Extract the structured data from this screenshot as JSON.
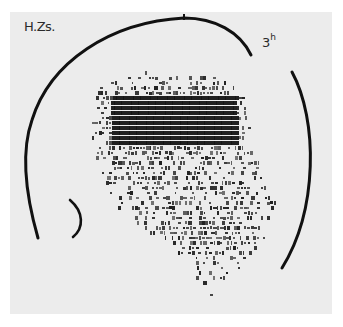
{
  "figure": {
    "subject_label": "H.Zs.",
    "time_label": {
      "value": "3",
      "unit": "h"
    },
    "background_color": "#ececec",
    "ink_color": "#151515"
  },
  "head_outline": {
    "main_arc_path": "M 38 238 C 30 210 18 160 32 120 C 50 62 110 22 184 18 C 215 18 240 32 251 55",
    "right_arc_path": "M 292 72 C 318 120 318 210 282 268",
    "ear_arc_path": "M 70 200 C 84 212 84 228 73 237",
    "top_tick": {
      "x": 184,
      "y1": 14,
      "y2": 20
    }
  },
  "chart_data": {
    "type": "heatmap",
    "row_height_px": 4.8,
    "rows": [
      {
        "y": 66,
        "x0": 160,
        "x1": 210,
        "density": 0.08
      },
      {
        "y": 71,
        "x0": 128,
        "x1": 215,
        "density": 0.15
      },
      {
        "y": 76,
        "x0": 118,
        "x1": 225,
        "density": 0.3
      },
      {
        "y": 81,
        "x0": 108,
        "x1": 232,
        "density": 0.45
      },
      {
        "y": 86,
        "x0": 100,
        "x1": 240,
        "density": 0.6
      },
      {
        "y": 91,
        "x0": 98,
        "x1": 244,
        "density": 0.8
      },
      {
        "y": 96,
        "x0": 96,
        "x1": 246,
        "density": 0.92
      },
      {
        "y": 101,
        "x0": 94,
        "x1": 248,
        "density": 0.97
      },
      {
        "y": 106,
        "x0": 94,
        "x1": 250,
        "density": 0.97
      },
      {
        "y": 111,
        "x0": 94,
        "x1": 250,
        "density": 0.96
      },
      {
        "y": 116,
        "x0": 92,
        "x1": 250,
        "density": 0.95
      },
      {
        "y": 121,
        "x0": 92,
        "x1": 250,
        "density": 0.94
      },
      {
        "y": 126,
        "x0": 92,
        "x1": 250,
        "density": 0.92
      },
      {
        "y": 131,
        "x0": 92,
        "x1": 250,
        "density": 0.9
      },
      {
        "y": 136,
        "x0": 92,
        "x1": 252,
        "density": 0.85
      },
      {
        "y": 141,
        "x0": 92,
        "x1": 252,
        "density": 0.8
      },
      {
        "y": 146,
        "x0": 92,
        "x1": 252,
        "density": 0.72
      },
      {
        "y": 151,
        "x0": 94,
        "x1": 254,
        "density": 0.65
      },
      {
        "y": 156,
        "x0": 96,
        "x1": 256,
        "density": 0.6
      },
      {
        "y": 161,
        "x0": 98,
        "x1": 258,
        "density": 0.55
      },
      {
        "y": 166,
        "x0": 100,
        "x1": 260,
        "density": 0.5
      },
      {
        "y": 171,
        "x0": 102,
        "x1": 262,
        "density": 0.45
      },
      {
        "y": 176,
        "x0": 104,
        "x1": 264,
        "density": 0.45
      },
      {
        "y": 181,
        "x0": 106,
        "x1": 266,
        "density": 0.5
      },
      {
        "y": 186,
        "x0": 108,
        "x1": 268,
        "density": 0.5
      },
      {
        "y": 191,
        "x0": 110,
        "x1": 270,
        "density": 0.45
      },
      {
        "y": 196,
        "x0": 112,
        "x1": 272,
        "density": 0.45
      },
      {
        "y": 201,
        "x0": 114,
        "x1": 274,
        "density": 0.45
      },
      {
        "y": 206,
        "x0": 118,
        "x1": 274,
        "density": 0.5
      },
      {
        "y": 211,
        "x0": 122,
        "x1": 274,
        "density": 0.55
      },
      {
        "y": 216,
        "x0": 128,
        "x1": 272,
        "density": 0.55
      },
      {
        "y": 221,
        "x0": 134,
        "x1": 270,
        "density": 0.6
      },
      {
        "y": 226,
        "x0": 142,
        "x1": 268,
        "density": 0.6
      },
      {
        "y": 231,
        "x0": 150,
        "x1": 266,
        "density": 0.62
      },
      {
        "y": 236,
        "x0": 158,
        "x1": 264,
        "density": 0.62
      },
      {
        "y": 241,
        "x0": 166,
        "x1": 260,
        "density": 0.6
      },
      {
        "y": 246,
        "x0": 172,
        "x1": 256,
        "density": 0.55
      },
      {
        "y": 251,
        "x0": 178,
        "x1": 252,
        "density": 0.5
      },
      {
        "y": 256,
        "x0": 182,
        "x1": 248,
        "density": 0.45
      },
      {
        "y": 261,
        "x0": 186,
        "x1": 244,
        "density": 0.38
      },
      {
        "y": 266,
        "x0": 190,
        "x1": 240,
        "density": 0.3
      },
      {
        "y": 271,
        "x0": 192,
        "x1": 236,
        "density": 0.22
      },
      {
        "y": 276,
        "x0": 196,
        "x1": 232,
        "density": 0.18
      },
      {
        "y": 281,
        "x0": 200,
        "x1": 228,
        "density": 0.14
      },
      {
        "y": 286,
        "x0": 204,
        "x1": 226,
        "density": 0.1
      },
      {
        "y": 293,
        "x0": 210,
        "x1": 226,
        "density": 0.06
      }
    ],
    "dense_core": {
      "x0": 110,
      "x1": 236,
      "y0": 92,
      "y1": 142
    },
    "grid": false,
    "legend": null
  }
}
